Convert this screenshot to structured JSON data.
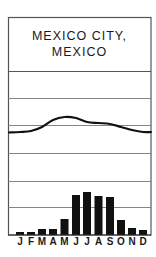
{
  "title": {
    "line1": "MEXICO CITY,",
    "line2": "MEXICO"
  },
  "colors": {
    "frame": "#555555",
    "grid": "#777777",
    "bars": "#111111",
    "curve": "#111111",
    "background": "#ffffff"
  },
  "chart_data": {
    "type": "bar",
    "subtitle": "Climograph: monthly precipitation (bars) and temperature (line)",
    "categories": [
      "J",
      "F",
      "M",
      "A",
      "M",
      "J",
      "J",
      "A",
      "S",
      "O",
      "N",
      "D"
    ],
    "series": [
      {
        "name": "Precipitation (relative bar height, px)",
        "type": "bar",
        "values": [
          3,
          3,
          6,
          6,
          16,
          40,
          43,
          39,
          38,
          15,
          7,
          5
        ]
      },
      {
        "name": "Temperature (curve y-position, px from top)",
        "type": "line",
        "values": [
          132,
          131,
          127,
          120,
          117,
          118,
          122,
          123,
          124,
          127,
          130,
          132
        ]
      }
    ],
    "xlabel": "",
    "ylabel": "",
    "grid": true,
    "gridlines_y_px": [
      71,
      98,
      125,
      153,
      181,
      207
    ],
    "legend": "none",
    "axis_tick_labels_shown": false
  }
}
